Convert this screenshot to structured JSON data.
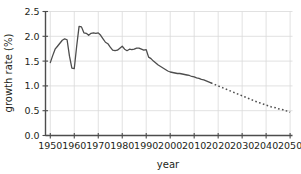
{
  "chart_data": {
    "type": "line",
    "title": "",
    "xlabel": "year",
    "ylabel": "growth rate (%)",
    "xlim": [
      1948,
      2051
    ],
    "ylim": [
      0.0,
      2.5
    ],
    "grid": true,
    "legend": "none",
    "xticks": [
      1950,
      1960,
      1970,
      1980,
      1990,
      2000,
      2010,
      2020,
      2030,
      2040,
      2050
    ],
    "xtick_labels": [
      "1950",
      "1960",
      "1970",
      "1980",
      "1990",
      "2000",
      "2010",
      "2020",
      "2030",
      "2040",
      "2050"
    ],
    "yticks": [
      0.0,
      0.5,
      1.0,
      1.5,
      2.0,
      2.5
    ],
    "ytick_labels": [
      "0.0",
      "0.5",
      "1.0",
      "1.5",
      "2.0",
      "2.5"
    ],
    "line_color": "#4d4d4d",
    "grid_color": "#d9d9d9",
    "axis_color": "#4d4d4d",
    "series": [
      {
        "name": "historical",
        "style": "solid",
        "x": [
          1950,
          1951,
          1952,
          1953,
          1954,
          1955,
          1956,
          1957,
          1958,
          1959,
          1960,
          1961,
          1962,
          1963,
          1964,
          1965,
          1966,
          1967,
          1968,
          1969,
          1970,
          1971,
          1972,
          1973,
          1974,
          1975,
          1976,
          1977,
          1978,
          1979,
          1980,
          1981,
          1982,
          1983,
          1984,
          1985,
          1986,
          1987,
          1988,
          1989,
          1990,
          1991,
          1992,
          1993,
          1994,
          1995,
          1996,
          1997,
          1998,
          1999,
          2000,
          2001,
          2002,
          2003,
          2004,
          2005,
          2006,
          2007,
          2008,
          2009,
          2010,
          2011,
          2012,
          2013,
          2014,
          2015,
          2016,
          2017
        ],
        "y": [
          1.47,
          1.61,
          1.74,
          1.8,
          1.86,
          1.92,
          1.95,
          1.93,
          1.6,
          1.36,
          1.35,
          1.8,
          2.2,
          2.19,
          2.07,
          2.06,
          2.02,
          2.06,
          2.07,
          2.06,
          2.07,
          2.02,
          1.95,
          1.88,
          1.85,
          1.78,
          1.72,
          1.71,
          1.72,
          1.76,
          1.8,
          1.74,
          1.71,
          1.74,
          1.73,
          1.74,
          1.76,
          1.76,
          1.74,
          1.72,
          1.73,
          1.58,
          1.55,
          1.5,
          1.46,
          1.42,
          1.39,
          1.36,
          1.33,
          1.3,
          1.28,
          1.27,
          1.26,
          1.25,
          1.25,
          1.24,
          1.23,
          1.22,
          1.21,
          1.19,
          1.18,
          1.16,
          1.15,
          1.13,
          1.12,
          1.1,
          1.08,
          1.06
        ]
      },
      {
        "name": "projection",
        "style": "dotted",
        "x": [
          2017,
          2018,
          2019,
          2020,
          2021,
          2022,
          2023,
          2024,
          2025,
          2026,
          2027,
          2028,
          2029,
          2030,
          2031,
          2032,
          2033,
          2034,
          2035,
          2036,
          2037,
          2038,
          2039,
          2040,
          2041,
          2042,
          2043,
          2044,
          2045,
          2046,
          2047,
          2048,
          2049,
          2050
        ],
        "y": [
          1.06,
          1.04,
          1.02,
          1.0,
          0.98,
          0.96,
          0.94,
          0.92,
          0.9,
          0.88,
          0.86,
          0.84,
          0.82,
          0.8,
          0.78,
          0.76,
          0.74,
          0.72,
          0.7,
          0.68,
          0.66,
          0.65,
          0.63,
          0.61,
          0.6,
          0.58,
          0.57,
          0.56,
          0.54,
          0.53,
          0.52,
          0.5,
          0.49,
          0.47
        ]
      }
    ]
  }
}
